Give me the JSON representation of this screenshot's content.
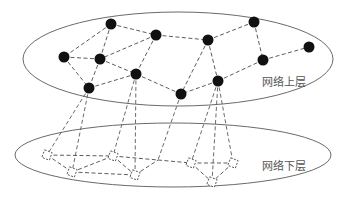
{
  "diagram": {
    "type": "two-layer network",
    "upper_layer": {
      "label": "网络上层",
      "label_pos": [
        262,
        86
      ],
      "ellipse": {
        "cx": 178,
        "cy": 59,
        "rx": 155,
        "ry": 47
      },
      "nodes": [
        {
          "id": "A",
          "x": 111,
          "y": 24
        },
        {
          "id": "B",
          "x": 156,
          "y": 35
        },
        {
          "id": "C",
          "x": 64,
          "y": 57
        },
        {
          "id": "D",
          "x": 100,
          "y": 59
        },
        {
          "id": "E",
          "x": 136,
          "y": 74
        },
        {
          "id": "F",
          "x": 89,
          "y": 88
        },
        {
          "id": "G",
          "x": 208,
          "y": 40
        },
        {
          "id": "H",
          "x": 254,
          "y": 22
        },
        {
          "id": "I",
          "x": 309,
          "y": 47
        },
        {
          "id": "J",
          "x": 263,
          "y": 60
        },
        {
          "id": "K",
          "x": 218,
          "y": 81
        },
        {
          "id": "L",
          "x": 181,
          "y": 94
        }
      ],
      "edges": [
        [
          "A",
          "C"
        ],
        [
          "A",
          "D"
        ],
        [
          "A",
          "B"
        ],
        [
          "B",
          "D"
        ],
        [
          "B",
          "G"
        ],
        [
          "B",
          "E"
        ],
        [
          "C",
          "D"
        ],
        [
          "C",
          "F"
        ],
        [
          "D",
          "F"
        ],
        [
          "D",
          "E"
        ],
        [
          "F",
          "E"
        ],
        [
          "E",
          "L"
        ],
        [
          "G",
          "H"
        ],
        [
          "G",
          "L"
        ],
        [
          "G",
          "K"
        ],
        [
          "H",
          "J"
        ],
        [
          "J",
          "I"
        ],
        [
          "J",
          "K"
        ],
        [
          "K",
          "L"
        ]
      ]
    },
    "lower_layer": {
      "label": "网络下层",
      "label_pos": [
        262,
        170
      ],
      "ellipse": {
        "cx": 173,
        "cy": 155,
        "rx": 158,
        "ry": 32
      },
      "nodes": [
        {
          "id": "s1",
          "x": 47,
          "y": 155
        },
        {
          "id": "s2",
          "x": 72,
          "y": 172
        },
        {
          "id": "s3",
          "x": 113,
          "y": 156
        },
        {
          "id": "s4",
          "x": 135,
          "y": 175
        },
        {
          "id": "s5",
          "x": 191,
          "y": 163
        },
        {
          "id": "s6",
          "x": 233,
          "y": 163
        },
        {
          "id": "s7",
          "x": 212,
          "y": 182
        }
      ],
      "junctions": [
        {
          "id": "j1",
          "x": 158,
          "y": 160
        }
      ],
      "edges": [
        [
          "s1",
          "s3"
        ],
        [
          "s1",
          "s2"
        ],
        [
          "s2",
          "s3"
        ],
        [
          "s2",
          "s4"
        ],
        [
          "s3",
          "s4"
        ],
        [
          "s3",
          "j1"
        ],
        [
          "j1",
          "s5"
        ],
        [
          "s4",
          "j1"
        ],
        [
          "s5",
          "s6"
        ],
        [
          "s5",
          "s7"
        ],
        [
          "s6",
          "s7"
        ]
      ]
    },
    "interlayer_edges": [
      [
        "F",
        "s1"
      ],
      [
        "F",
        "s2"
      ],
      [
        "E",
        "s3"
      ],
      [
        "E",
        "s4"
      ],
      [
        "L",
        "j1"
      ],
      [
        "K",
        "s5"
      ],
      [
        "K",
        "s7"
      ],
      [
        "K",
        "s6"
      ]
    ]
  }
}
